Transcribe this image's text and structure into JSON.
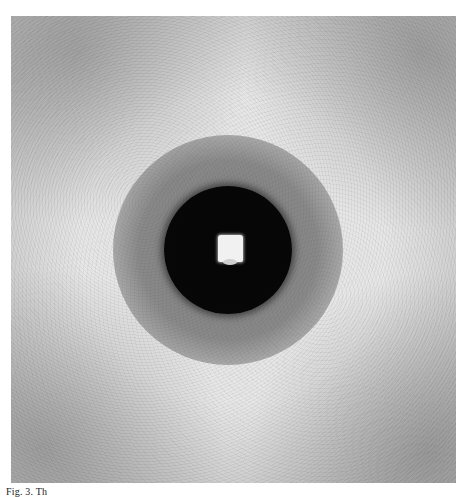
{
  "figure": {
    "colors": {
      "background": "#e6e6e6",
      "central_disc": "#050505",
      "beam_stop": "#f1f1f1",
      "ring": "#5a5a5a"
    }
  },
  "caption": {
    "text": "Fig. 3. Th"
  }
}
